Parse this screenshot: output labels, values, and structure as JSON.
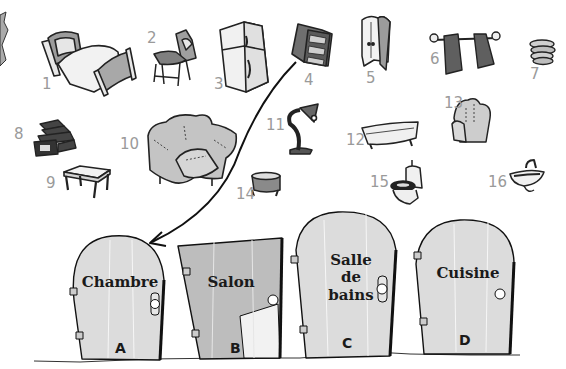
{
  "items": [
    {
      "number": "1",
      "icon": "bed-icon"
    },
    {
      "number": "2",
      "icon": "chair-icon"
    },
    {
      "number": "3",
      "icon": "fridge-icon"
    },
    {
      "number": "4",
      "icon": "bookcase-icon"
    },
    {
      "number": "5",
      "icon": "wardrobe-icon"
    },
    {
      "number": "6",
      "icon": "towels-icon"
    },
    {
      "number": "7",
      "icon": "plates-icon"
    },
    {
      "number": "8",
      "icon": "video-tapes-icon"
    },
    {
      "number": "9",
      "icon": "table-icon"
    },
    {
      "number": "10",
      "icon": "sofa-icon"
    },
    {
      "number": "11",
      "icon": "desk-lamp-icon"
    },
    {
      "number": "12",
      "icon": "bathtub-icon"
    },
    {
      "number": "13",
      "icon": "armchair-icon"
    },
    {
      "number": "14",
      "icon": "cooking-pot-icon"
    },
    {
      "number": "15",
      "icon": "toilet-icon"
    },
    {
      "number": "16",
      "icon": "sink-icon"
    }
  ],
  "doors": [
    {
      "letter": "A",
      "label": "Chambre"
    },
    {
      "letter": "B",
      "label": "Salon"
    },
    {
      "letter": "C",
      "label_lines": [
        "Salle",
        "de",
        "bains"
      ]
    },
    {
      "letter": "D",
      "label": "Cuisine"
    }
  ],
  "arrow": {
    "from_item": "4",
    "to_door": "A"
  },
  "colors": {
    "door_fill": "#dcdcdc",
    "salon_fill": "#bdbdbd",
    "number_gray": "#9a9a9a",
    "ink": "#1a1a1a"
  }
}
